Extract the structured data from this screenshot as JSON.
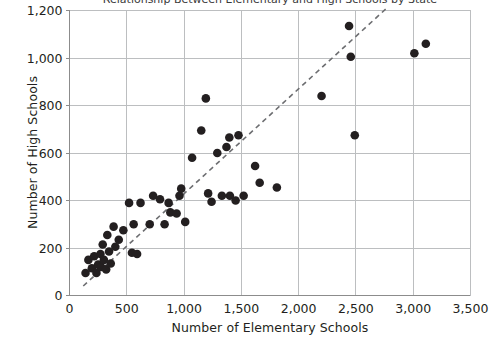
{
  "chart_data": {
    "type": "scatter",
    "title": "Relationship Between Elementary and High Schools by State",
    "xlabel": "Number of Elementary Schools",
    "ylabel": "Number of High Schools",
    "xlim": [
      0,
      3500
    ],
    "ylim": [
      0,
      1200
    ],
    "xticks": [
      0,
      500,
      1000,
      1500,
      2000,
      2500,
      3000,
      3500
    ],
    "yticks": [
      0,
      200,
      400,
      600,
      800,
      1000,
      1200
    ],
    "xtick_labels": [
      "0",
      "500",
      "1,000",
      "1,500",
      "2,000",
      "2,500",
      "3,000",
      "3,500"
    ],
    "ytick_labels": [
      "0",
      "200",
      "400",
      "600",
      "800",
      "1,000",
      "1,200"
    ],
    "grid": true,
    "legend": false,
    "marker_color": "#231f20",
    "marker_size": 6,
    "trendline": {
      "style": "dashed",
      "color": "#6d6e71",
      "x_start": 120,
      "y_start": 40,
      "x_end": 2780,
      "y_end": 1215
    },
    "points": [
      {
        "x": 140,
        "y": 95
      },
      {
        "x": 165,
        "y": 150
      },
      {
        "x": 195,
        "y": 115
      },
      {
        "x": 215,
        "y": 165
      },
      {
        "x": 235,
        "y": 95
      },
      {
        "x": 250,
        "y": 130
      },
      {
        "x": 270,
        "y": 175
      },
      {
        "x": 275,
        "y": 120
      },
      {
        "x": 290,
        "y": 215
      },
      {
        "x": 300,
        "y": 150
      },
      {
        "x": 320,
        "y": 110
      },
      {
        "x": 330,
        "y": 255
      },
      {
        "x": 345,
        "y": 185
      },
      {
        "x": 360,
        "y": 135
      },
      {
        "x": 385,
        "y": 290
      },
      {
        "x": 400,
        "y": 205
      },
      {
        "x": 430,
        "y": 235
      },
      {
        "x": 470,
        "y": 275
      },
      {
        "x": 520,
        "y": 390
      },
      {
        "x": 545,
        "y": 180
      },
      {
        "x": 560,
        "y": 300
      },
      {
        "x": 590,
        "y": 175
      },
      {
        "x": 620,
        "y": 390
      },
      {
        "x": 700,
        "y": 300
      },
      {
        "x": 730,
        "y": 420
      },
      {
        "x": 790,
        "y": 405
      },
      {
        "x": 830,
        "y": 300
      },
      {
        "x": 865,
        "y": 390
      },
      {
        "x": 880,
        "y": 350
      },
      {
        "x": 935,
        "y": 345
      },
      {
        "x": 960,
        "y": 420
      },
      {
        "x": 975,
        "y": 450
      },
      {
        "x": 1010,
        "y": 310
      },
      {
        "x": 1070,
        "y": 580
      },
      {
        "x": 1150,
        "y": 695
      },
      {
        "x": 1190,
        "y": 830
      },
      {
        "x": 1210,
        "y": 430
      },
      {
        "x": 1240,
        "y": 395
      },
      {
        "x": 1290,
        "y": 600
      },
      {
        "x": 1330,
        "y": 420
      },
      {
        "x": 1370,
        "y": 625
      },
      {
        "x": 1395,
        "y": 665
      },
      {
        "x": 1400,
        "y": 420
      },
      {
        "x": 1450,
        "y": 400
      },
      {
        "x": 1475,
        "y": 675
      },
      {
        "x": 1520,
        "y": 420
      },
      {
        "x": 1620,
        "y": 545
      },
      {
        "x": 1660,
        "y": 475
      },
      {
        "x": 1810,
        "y": 455
      },
      {
        "x": 2200,
        "y": 840
      },
      {
        "x": 2440,
        "y": 1135
      },
      {
        "x": 2455,
        "y": 1005
      },
      {
        "x": 2490,
        "y": 675
      },
      {
        "x": 3010,
        "y": 1020
      },
      {
        "x": 3110,
        "y": 1060
      }
    ]
  }
}
